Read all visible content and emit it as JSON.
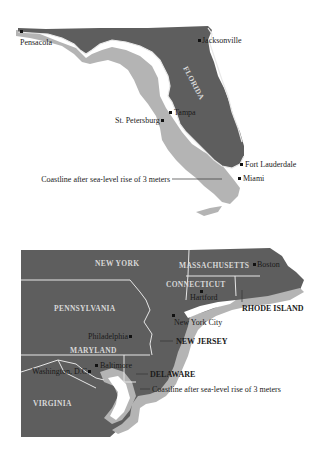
{
  "colors": {
    "current_land": "#5e5e5e",
    "flooded_land": "#b4b4b4",
    "background": "#ffffff",
    "borders": "#e6e6e6",
    "text": "#1a1a1a"
  },
  "florida_map": {
    "state_label": "FLORIDA",
    "cities": [
      {
        "name": "Pensacola"
      },
      {
        "name": "Jacksonville"
      },
      {
        "name": "Tampa"
      },
      {
        "name": "St. Petersburg"
      },
      {
        "name": "Fort Lauderdale"
      },
      {
        "name": "Miami"
      }
    ],
    "legend_annotation": "Coastline after sea-level rise of 3 meters"
  },
  "northeast_map": {
    "state_labels": {
      "new_york": "NEW YORK",
      "massachusetts": "MASSACHUSETTS",
      "connecticut": "CONNECTICUT",
      "pennsylvania": "PENNSYLVANIA",
      "maryland": "MARYLAND",
      "virginia": "VIRGINIA",
      "rhode_island": "RHODE ISLAND",
      "new_jersey": "NEW JERSEY",
      "delaware": "DELAWARE"
    },
    "cities": [
      {
        "name": "Boston"
      },
      {
        "name": "Hartford"
      },
      {
        "name": "New York City"
      },
      {
        "name": "Philadelphia"
      },
      {
        "name": "Baltimore"
      },
      {
        "name": "Washington, D.C."
      }
    ],
    "legend_annotation": "Coastline after sea-level rise of 3 meters"
  }
}
